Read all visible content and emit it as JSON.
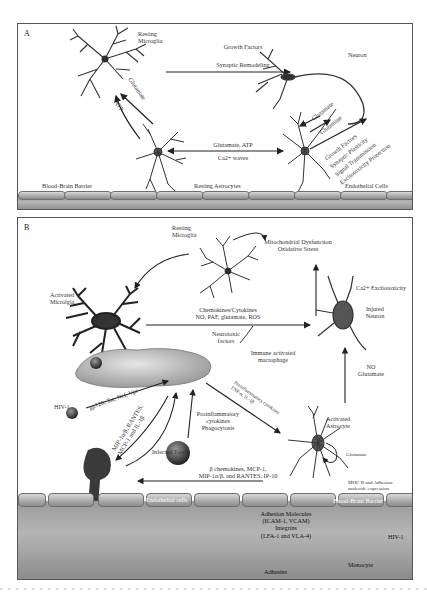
{
  "figure": {
    "panels": [
      {
        "id": "A",
        "label": "A",
        "cells": {
          "resting_microglia": "Resting\nMicroglia",
          "neuron": "Neuron"
        },
        "arrows": {
          "microglia_to_neuron_top": "Growth Factors",
          "microglia_to_neuron_bottom": "Synaptic Remodeling",
          "astro_to_microglia_1": "Glutamate",
          "astro_to_microglia_2": "ATP",
          "astro_astro_top": "Glutamate, ATP",
          "astro_astro_bottom": "Ca2+ waves",
          "neuron_astro_1": "Glutamate",
          "neuron_astro_2": "Glutamine",
          "astro_neuron_list": [
            "Growth Factors",
            "Synaptic Plasticity",
            "Signal Transmission",
            "Excitotoxicity Protection"
          ]
        },
        "barrier_labels": {
          "left": "Blood-Brain Barrier",
          "middle": "Resting Astrocytes",
          "right": "Endothelial Cells"
        }
      },
      {
        "id": "B",
        "label": "B",
        "cells": {
          "resting_microglia": "Resting\nMicroglia",
          "activated_microglia": "Activated\nMicrolgia",
          "injured_neuron": "Injured\nNeuron",
          "macrophage": "Immune activated\nmacrophage",
          "activated_astrocyte": "Activated\nAstrocyte",
          "hiv_left": "HIV-1",
          "infected_tcell": "Infected T-cell",
          "monocyte": "Monocyte",
          "hiv_right": "HIV-1"
        },
        "annotations": {
          "mito": "Mitochondrial Dysfunction\nOxidative Stress",
          "ca_excito": "Ca2+ Excitotoxicity",
          "chemokines": "Chemokines/Cytokines\nNO, PAF, glutamate, ROS",
          "neurotoxic": "Neurotoxic\nfactors",
          "no_glutamate": "NO\nGlutamate",
          "gp120": "gp120, Tat, Nef, Vpr",
          "mip_left": "MIP-1α/β, RANTES,\nMCP-1 and IL-1β",
          "proinflam_center": "Proinflammatory\ncytokines\nPhagocytosis",
          "proinflam_diag": "Proinflammatory cytokines\nTNF-α, IL-1β",
          "glutamate_loop": "Glutamate",
          "mhc": "MHC II and Adhesion\nmolecule expression",
          "beta_chemokines": "β chemokines, MCP-1,\nMIP-1α/β, and RANTES, IP-10",
          "endothelial": "Endothelial cells",
          "bbb": "Blood-Brain Barrier",
          "adhesion_molecules": "Adhesion Molecules\n(ICAM-1, VCAM)\nIntegrins\n(LFA-1 and VLA-4)",
          "adhesins": "Adhesins"
        }
      }
    ]
  },
  "colors": {
    "line": "#333333",
    "cell_fill": "#3a3a3a",
    "barrier_light": "#d0d0d0",
    "barrier_dark": "#8c8c8c",
    "macrophage": "#c8c8c8",
    "border": "#555555"
  }
}
